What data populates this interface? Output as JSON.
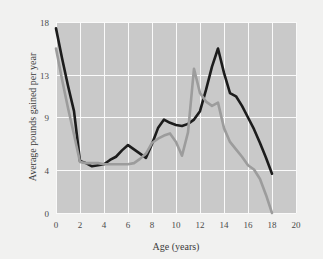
{
  "chart_data": {
    "type": "line",
    "title": "",
    "xlabel": "Age (years)",
    "ylabel": "Average pounds gained per year",
    "xlim": [
      0,
      20
    ],
    "ylim": [
      0,
      18
    ],
    "xticks": [
      0,
      2,
      4,
      6,
      8,
      10,
      12,
      14,
      16,
      18,
      20
    ],
    "xticklabels": [
      "0",
      "2",
      "4",
      "6",
      "8",
      "10",
      "12",
      "14",
      "16",
      "18",
      "20"
    ],
    "yticks": [
      0,
      4,
      9,
      13,
      18
    ],
    "yticklabels": [
      "0",
      "4",
      "9",
      "13",
      "18"
    ],
    "grid": true,
    "grid_color": "#fafafa",
    "plot_background": "#c9c9c9",
    "figure_background": "#f1f1f0",
    "legend": null,
    "legend_position": "none",
    "series": [
      {
        "name": "black-series",
        "color": "#1c1c1c",
        "linewidth": 2.6,
        "x": [
          0,
          0.5,
          1,
          1.5,
          2,
          2.5,
          3,
          3.5,
          4,
          4.5,
          5,
          5.5,
          6,
          6.5,
          7,
          7.5,
          8,
          8.5,
          9,
          9.5,
          10,
          10.5,
          11,
          11.5,
          12,
          12.5,
          13,
          13.5,
          14,
          14.5,
          15,
          15.5,
          16,
          16.5,
          17,
          17.5,
          18
        ],
        "y": [
          17.4,
          14.6,
          12.0,
          9.6,
          4.9,
          4.7,
          4.4,
          4.5,
          4.6,
          5.0,
          5.3,
          5.9,
          6.4,
          6.0,
          5.6,
          5.2,
          6.5,
          8.0,
          8.8,
          8.5,
          8.3,
          8.2,
          8.4,
          8.8,
          9.6,
          11.6,
          13.8,
          15.5,
          13.2,
          11.3,
          11.0,
          10.1,
          9.0,
          7.9,
          6.6,
          5.2,
          3.7
        ]
      },
      {
        "name": "gray-series",
        "color": "#9c9c9c",
        "linewidth": 2.6,
        "x": [
          0,
          0.5,
          1,
          1.5,
          2,
          2.5,
          3,
          3.5,
          4,
          4.5,
          5,
          5.5,
          6,
          6.5,
          7,
          7.5,
          8,
          8.5,
          9,
          9.5,
          10,
          10.5,
          11,
          11.5,
          12,
          12.5,
          13,
          13.5,
          14,
          14.5,
          15,
          15.5,
          16,
          16.5,
          17,
          17.5,
          18
        ],
        "y": [
          15.5,
          12.6,
          9.9,
          7.4,
          4.8,
          4.7,
          4.7,
          4.7,
          4.6,
          4.6,
          4.6,
          4.6,
          4.6,
          4.7,
          5.1,
          5.6,
          6.6,
          7.0,
          7.3,
          7.5,
          6.7,
          5.4,
          7.6,
          13.6,
          11.3,
          10.5,
          10.1,
          10.4,
          8.0,
          6.7,
          6.0,
          5.3,
          4.5,
          4.1,
          3.2,
          1.7,
          0.0
        ]
      }
    ]
  }
}
